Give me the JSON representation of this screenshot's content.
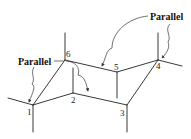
{
  "diagram": {
    "type": "chair-conformation-cyclohexane",
    "atoms": [
      {
        "label": "1",
        "x": 33,
        "y": 105
      },
      {
        "label": "2",
        "x": 73,
        "y": 93
      },
      {
        "label": "3",
        "x": 127,
        "y": 105
      },
      {
        "label": "4",
        "x": 158,
        "y": 60
      },
      {
        "label": "5",
        "x": 117,
        "y": 72
      },
      {
        "label": "6",
        "x": 65,
        "y": 60
      }
    ],
    "callouts": [
      {
        "text": "Parallel",
        "position": "left"
      },
      {
        "text": "Parallel",
        "position": "top-right"
      }
    ],
    "colors": {
      "line": "#222222",
      "text": "#111111",
      "background": "#ffffff"
    }
  }
}
